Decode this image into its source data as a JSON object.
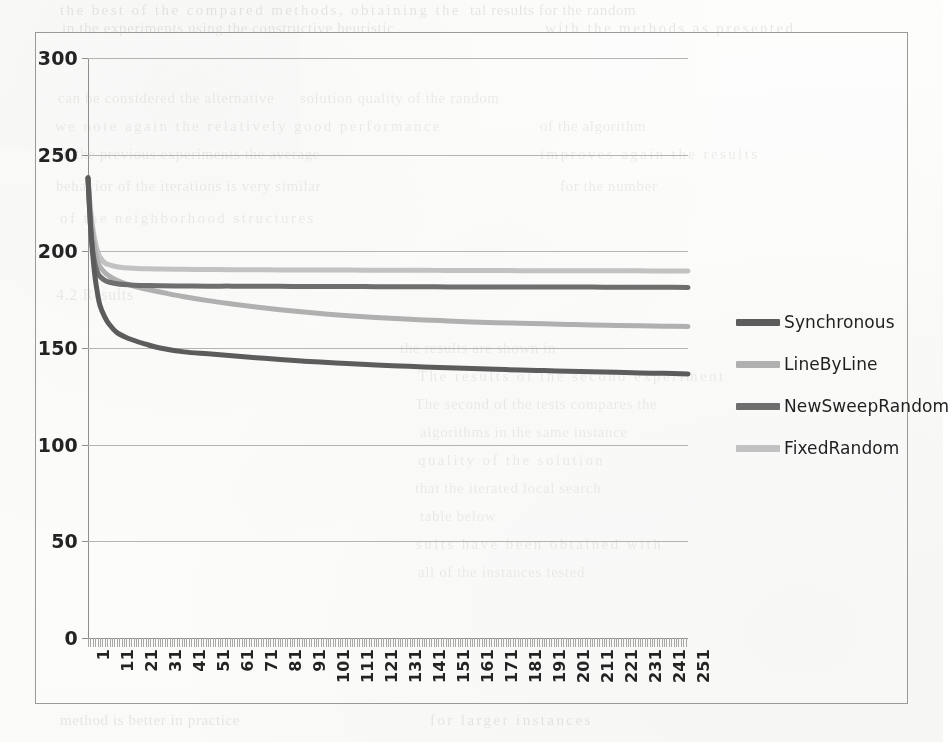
{
  "chart_data": {
    "type": "line",
    "title": "",
    "xlabel": "",
    "ylabel": "",
    "xlim": [
      1,
      251
    ],
    "ylim": [
      0,
      300
    ],
    "y_ticks": [
      300,
      250,
      200,
      150,
      100,
      50,
      0
    ],
    "x_tick_labels": [
      "1",
      "11",
      "21",
      "31",
      "41",
      "51",
      "61",
      "71",
      "81",
      "91",
      "101",
      "111",
      "121",
      "131",
      "141",
      "151",
      "161",
      "171",
      "181",
      "191",
      "201",
      "211",
      "221",
      "231",
      "241",
      "251"
    ],
    "x_tick_step": 10,
    "x_minor_tick_count": 251,
    "grid": true,
    "grid_axis": "y",
    "legend_position": "right",
    "series": [
      {
        "name": "Synchronous",
        "color": "#5c5c5c",
        "x": [
          1,
          2,
          3,
          4,
          5,
          6,
          8,
          10,
          13,
          16,
          20,
          25,
          31,
          41,
          51,
          61,
          71,
          81,
          91,
          101,
          111,
          121,
          131,
          141,
          151,
          161,
          171,
          181,
          191,
          201,
          211,
          221,
          231,
          241,
          251
        ],
        "values": [
          238,
          214,
          198,
          186,
          178,
          172,
          166,
          162,
          158,
          156,
          154,
          152,
          150,
          148,
          147,
          146,
          145,
          144,
          143.2,
          142.5,
          141.8,
          141.2,
          140.7,
          140.2,
          139.8,
          139.4,
          139.0,
          138.6,
          138.3,
          138.0,
          137.7,
          137.4,
          137.1,
          136.9,
          136.6
        ]
      },
      {
        "name": "LineByLine",
        "color": "#b0b0b0",
        "x": [
          1,
          2,
          3,
          4,
          5,
          6,
          8,
          10,
          13,
          16,
          20,
          25,
          31,
          41,
          51,
          61,
          71,
          81,
          91,
          101,
          111,
          121,
          131,
          141,
          151,
          161,
          171,
          181,
          191,
          201,
          211,
          221,
          231,
          241,
          251
        ],
        "values": [
          238,
          220,
          208,
          200,
          195,
          192,
          189,
          187,
          185,
          183.5,
          182,
          180.5,
          179,
          176.5,
          174.5,
          172.8,
          171.2,
          169.8,
          168.6,
          167.5,
          166.6,
          165.8,
          165.1,
          164.5,
          164.0,
          163.5,
          163.1,
          162.8,
          162.5,
          162.2,
          161.9,
          161.7,
          161.5,
          161.3,
          161.1
        ]
      },
      {
        "name": "NewSweepRandom",
        "color": "#6e6e6e",
        "x": [
          1,
          2,
          3,
          4,
          5,
          6,
          8,
          10,
          13,
          16,
          20,
          25,
          31,
          41,
          51,
          61,
          71,
          81,
          91,
          101,
          111,
          121,
          131,
          141,
          151,
          161,
          171,
          181,
          191,
          201,
          211,
          221,
          231,
          241,
          251
        ],
        "values": [
          238,
          214,
          200,
          193,
          189,
          187,
          185,
          184,
          183.2,
          182.8,
          182.5,
          182.3,
          182.2,
          182.1,
          182.0,
          182.0,
          181.9,
          181.9,
          181.8,
          181.8,
          181.8,
          181.7,
          181.7,
          181.7,
          181.6,
          181.6,
          181.6,
          181.6,
          181.5,
          181.5,
          181.5,
          181.4,
          181.4,
          181.4,
          181.3
        ]
      },
      {
        "name": "FixedRandom",
        "color": "#c2c2c2",
        "x": [
          1,
          2,
          3,
          4,
          5,
          6,
          8,
          10,
          13,
          16,
          20,
          25,
          31,
          41,
          51,
          61,
          71,
          81,
          91,
          101,
          111,
          121,
          131,
          141,
          151,
          161,
          171,
          181,
          191,
          201,
          211,
          221,
          231,
          241,
          251
        ],
        "values": [
          238,
          222,
          212,
          205,
          200,
          197,
          194,
          193,
          192,
          191.5,
          191.2,
          191.0,
          190.8,
          190.7,
          190.6,
          190.5,
          190.5,
          190.4,
          190.4,
          190.3,
          190.3,
          190.2,
          190.2,
          190.2,
          190.1,
          190.1,
          190.1,
          190.0,
          190.0,
          190.0,
          189.9,
          189.9,
          189.9,
          189.8,
          189.8
        ]
      }
    ]
  },
  "legend": {
    "items": [
      {
        "label": "Synchronous",
        "color": "#5c5c5c"
      },
      {
        "label": "LineByLine",
        "color": "#b0b0b0"
      },
      {
        "label": "NewSweepRandom",
        "color": "#6e6e6e"
      },
      {
        "label": "FixedRandom",
        "color": "#c2c2c2"
      }
    ]
  },
  "page_background": {
    "bleed_through_lines": [
      {
        "text": "the best of the compared methods, obtaining the",
        "x": 60,
        "y": 2,
        "size": 15
      },
      {
        "text": "tal results for the random",
        "x": 470,
        "y": 2,
        "size": 15
      },
      {
        "text": "in the experiments using the constructive heuristic",
        "x": 62,
        "y": 20,
        "size": 15
      },
      {
        "text": "with the methods as presented",
        "x": 545,
        "y": 20,
        "size": 15
      },
      {
        "text": "can be considered the alternative",
        "x": 58,
        "y": 90,
        "size": 15
      },
      {
        "text": "solution quality of the random",
        "x": 300,
        "y": 90,
        "size": 15
      },
      {
        "text": "we note again the relatively good performance",
        "x": 55,
        "y": 118,
        "size": 15
      },
      {
        "text": "of the algorithm",
        "x": 540,
        "y": 118,
        "size": 15
      },
      {
        "text": "in the previous experiments the average",
        "x": 58,
        "y": 146,
        "size": 15
      },
      {
        "text": "improves again the results",
        "x": 540,
        "y": 146,
        "size": 15
      },
      {
        "text": "behavior of the iterations is very similar",
        "x": 56,
        "y": 178,
        "size": 15
      },
      {
        "text": "for the number",
        "x": 560,
        "y": 178,
        "size": 15
      },
      {
        "text": "of the neighborhood structures",
        "x": 60,
        "y": 210,
        "size": 15
      },
      {
        "text": "4.2  Results",
        "x": 56,
        "y": 286,
        "size": 16
      },
      {
        "text": "the results are shown in",
        "x": 400,
        "y": 340,
        "size": 15
      },
      {
        "text": "The results of the second experiment",
        "x": 418,
        "y": 368,
        "size": 15
      },
      {
        "text": "The second of the tests compares the",
        "x": 415,
        "y": 396,
        "size": 15
      },
      {
        "text": "algorithms in the same instance",
        "x": 420,
        "y": 424,
        "size": 15
      },
      {
        "text": "quality of the solution",
        "x": 418,
        "y": 452,
        "size": 15
      },
      {
        "text": "that the iterated local search",
        "x": 415,
        "y": 480,
        "size": 15
      },
      {
        "text": "table below",
        "x": 420,
        "y": 508,
        "size": 15
      },
      {
        "text": "sults have been obtained with",
        "x": 416,
        "y": 536,
        "size": 15
      },
      {
        "text": "all of the instances tested",
        "x": 418,
        "y": 564,
        "size": 15
      },
      {
        "text": "method is better in practice",
        "x": 60,
        "y": 712,
        "size": 15
      },
      {
        "text": "for larger instances",
        "x": 430,
        "y": 712,
        "size": 15
      }
    ]
  }
}
